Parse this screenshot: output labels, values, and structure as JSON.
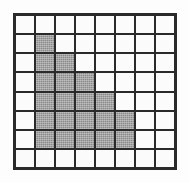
{
  "figure": {
    "name": "shaded-grid-figure",
    "rows": 8,
    "columns": 8,
    "background_color": "#fdfdfd",
    "gridline_color": "#2a2a2a",
    "empty_cell_color": "#fbfbfb",
    "filled_cell_color": "#8a8a8a",
    "filled_cell_count": 16,
    "empty_cell_count": 48,
    "cells": [
      [
        0,
        0,
        0,
        0,
        0,
        0,
        0,
        0
      ],
      [
        0,
        1,
        0,
        0,
        0,
        0,
        0,
        0
      ],
      [
        0,
        1,
        1,
        0,
        0,
        0,
        0,
        0
      ],
      [
        0,
        1,
        1,
        1,
        0,
        0,
        0,
        0
      ],
      [
        0,
        1,
        1,
        1,
        1,
        0,
        0,
        0
      ],
      [
        0,
        1,
        1,
        1,
        1,
        1,
        0,
        0
      ],
      [
        0,
        1,
        1,
        1,
        1,
        1,
        0,
        0
      ],
      [
        0,
        0,
        0,
        0,
        0,
        0,
        0,
        0
      ]
    ]
  }
}
